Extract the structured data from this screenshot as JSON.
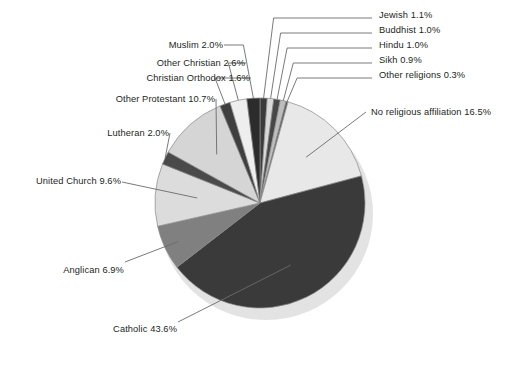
{
  "chart_data": {
    "type": "pie",
    "title": "",
    "subtitle": "",
    "xlabel": "",
    "ylabel": "",
    "legend_position": "none",
    "grid": false,
    "labels_show_percent": true,
    "start_angle_deg": 0,
    "direction": "clockwise",
    "units": "percent",
    "total": 100.0,
    "categories": [
      "Jewish",
      "Buddhist",
      "Hindu",
      "Sikh",
      "Other religions",
      "No religious affiliation",
      "Catholic",
      "Anglican",
      "United Church",
      "Lutheran",
      "Other Protestant",
      "Christian Orthodox",
      "Other Christian",
      "Muslim"
    ],
    "values": [
      1.1,
      1.0,
      1.0,
      0.9,
      0.3,
      16.5,
      43.6,
      6.9,
      9.6,
      2.0,
      10.7,
      1.6,
      2.6,
      2.0
    ],
    "slices": [
      {
        "name": "Jewish",
        "value": 1.1,
        "label": "Jewish 1.1%",
        "color": "#3b3b3b"
      },
      {
        "name": "Buddhist",
        "value": 1.0,
        "label": "Buddhist 1.0%",
        "color": "#d9d9d9"
      },
      {
        "name": "Hindu",
        "value": 1.0,
        "label": "Hindu 1.0%",
        "color": "#474747"
      },
      {
        "name": "Sikh",
        "value": 0.9,
        "label": "Sikh 0.9%",
        "color": "#bdbdbd"
      },
      {
        "name": "Other religions",
        "value": 0.3,
        "label": "Other religions 0.3%",
        "color": "#585858"
      },
      {
        "name": "No religious affiliation",
        "value": 16.5,
        "label": "No religious affiliation 16.5%",
        "color": "#e8e8e8"
      },
      {
        "name": "Catholic",
        "value": 43.6,
        "label": "Catholic 43.6%",
        "color": "#3a3a3a"
      },
      {
        "name": "Anglican",
        "value": 6.9,
        "label": "Anglican 6.9%",
        "color": "#808080"
      },
      {
        "name": "United Church",
        "value": 9.6,
        "label": "United Church 9.6%",
        "color": "#dcdcdc"
      },
      {
        "name": "Lutheran",
        "value": 2.0,
        "label": "Lutheran 2.0%",
        "color": "#4a4a4a"
      },
      {
        "name": "Other Protestant",
        "value": 10.7,
        "label": "Other Protestant 10.7%",
        "color": "#d5d5d5"
      },
      {
        "name": "Christian Orthodox",
        "value": 1.6,
        "label": "Christian Orthodox 1.6%",
        "color": "#3f3f3f"
      },
      {
        "name": "Other Christian",
        "value": 2.6,
        "label": "Other Christian 2.6%",
        "color": "#eeeeee"
      },
      {
        "name": "Muslim",
        "value": 2.0,
        "label": "Muslim 2.0%",
        "color": "#2c2c2c"
      }
    ]
  },
  "labels": {
    "jewish": "Jewish 1.1%",
    "buddhist": "Buddhist 1.0%",
    "hindu": "Hindu 1.0%",
    "sikh": "Sikh 0.9%",
    "other_religions": "Other religions 0.3%",
    "no_affiliation": "No religious affiliation 16.5%",
    "catholic": "Catholic 43.6%",
    "anglican": "Anglican 6.9%",
    "united_church": "United Church 9.6%",
    "lutheran": "Lutheran 2.0%",
    "other_protestant": "Other Protestant 10.7%",
    "christian_orthodox": "Christian Orthodox 1.6%",
    "other_christian": "Other Christian 2.6%",
    "muslim": "Muslim 2.0%"
  },
  "colors": {
    "text": "#231f20",
    "leader_line": "#6b6b6b",
    "slice_outline": "#8a8a8a",
    "shadow": "#e3e3e3",
    "background": "#ffffff"
  }
}
